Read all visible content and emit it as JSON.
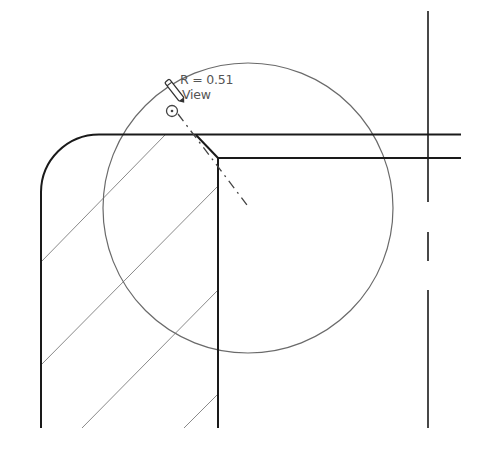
{
  "drawing": {
    "type": "CAD section view detail",
    "colors": {
      "background": "#ffffff",
      "object_line": "#1a1a1a",
      "hatch_line": "#8a8a8a",
      "detail_circle": "#6a6a6a",
      "centerline": "#444444",
      "annotation_text": "#555555"
    }
  },
  "annotation": {
    "radius_label": "R = 0.51",
    "view_label": "View",
    "icons": [
      "pencil-icon",
      "target-icon"
    ]
  }
}
